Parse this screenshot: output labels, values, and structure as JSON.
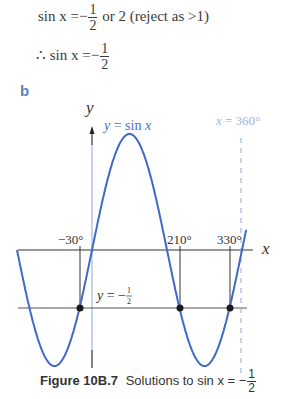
{
  "working": {
    "line1": {
      "lhs": "sin x",
      "equals": "=",
      "sign": "−",
      "num": "1",
      "den": "2",
      "rest": "or  2 (reject as >1)"
    },
    "line2": {
      "therefore": "∴",
      "lhs": "sin x",
      "equals": "=",
      "sign": "−",
      "num": "1",
      "den": "2"
    }
  },
  "part_label": "b",
  "caption": {
    "figure_label": "Figure 10B.7",
    "text": "Solutions to sin x = −",
    "num": "1",
    "den": "2"
  },
  "colors": {
    "curve": "#3f68c9",
    "axis": "#333333",
    "y_axis": "#8fa9df",
    "dashed": "#8fa9df",
    "label_blue": "#6f8fd6",
    "dot": "#1a1a1a"
  },
  "chart_data": {
    "type": "line",
    "xlabel": "x",
    "ylabel": "y",
    "series": [
      {
        "name": "y = sin x",
        "function": "sin(x)",
        "x_range_deg": [
          -180,
          370
        ]
      },
      {
        "name": "y = −1/2",
        "function": "-0.5",
        "style": "horizontal line"
      }
    ],
    "vertical_lines": [
      {
        "label": "x = 360°",
        "x": 360,
        "style": "dashed"
      }
    ],
    "solutions_marked": [
      {
        "label": "−30°",
        "x": -30,
        "y": -0.5
      },
      {
        "label": "210°",
        "x": 210,
        "y": -0.5
      },
      {
        "label": "330°",
        "x": 330,
        "y": -0.5
      }
    ],
    "annotations": [
      "y = sin x",
      "x = 360°",
      "y = −1/2",
      "−30°",
      "210°",
      "330°"
    ],
    "grid": false
  },
  "graph_labels": {
    "y_axis": "y",
    "x_axis": "x",
    "curve": "y = sin x",
    "dashed_line": "x = 360°",
    "hline_prefix": "y = −",
    "hline_num": "1",
    "hline_den": "2",
    "tick_m30": "−30°",
    "tick_210": "210°",
    "tick_330": "330°"
  }
}
